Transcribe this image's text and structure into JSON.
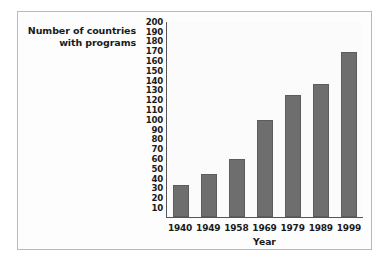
{
  "chart_data": {
    "type": "bar",
    "title": "",
    "xlabel": "Year",
    "ylabel": "Number of countries with programs",
    "ylabel_lines": [
      "Number of countries",
      "with programs"
    ],
    "categories": [
      "1940",
      "1949",
      "1958",
      "1969",
      "1979",
      "1989",
      "1999"
    ],
    "values": [
      33,
      44,
      59,
      99,
      124,
      136,
      168
    ],
    "ylim": [
      0,
      200
    ],
    "ytick_step": 10,
    "yticks": [
      "200",
      "190",
      "180",
      "170",
      "160",
      "150",
      "140",
      "130",
      "120",
      "110",
      "100",
      "90",
      "80",
      "70",
      "60",
      "50",
      "40",
      "30",
      "20",
      "10"
    ],
    "grid": false,
    "legend": false,
    "legend_position": "none",
    "colors": {
      "bar_fill": "#6e6e6e",
      "bar_stroke": "#5c5c5c",
      "axis_line": "#555555",
      "text": "#1a1a1a",
      "plot_background": "#fbfbfb",
      "figure_background": "#fdfdfd",
      "figure_border": "#b9b9b9"
    }
  }
}
